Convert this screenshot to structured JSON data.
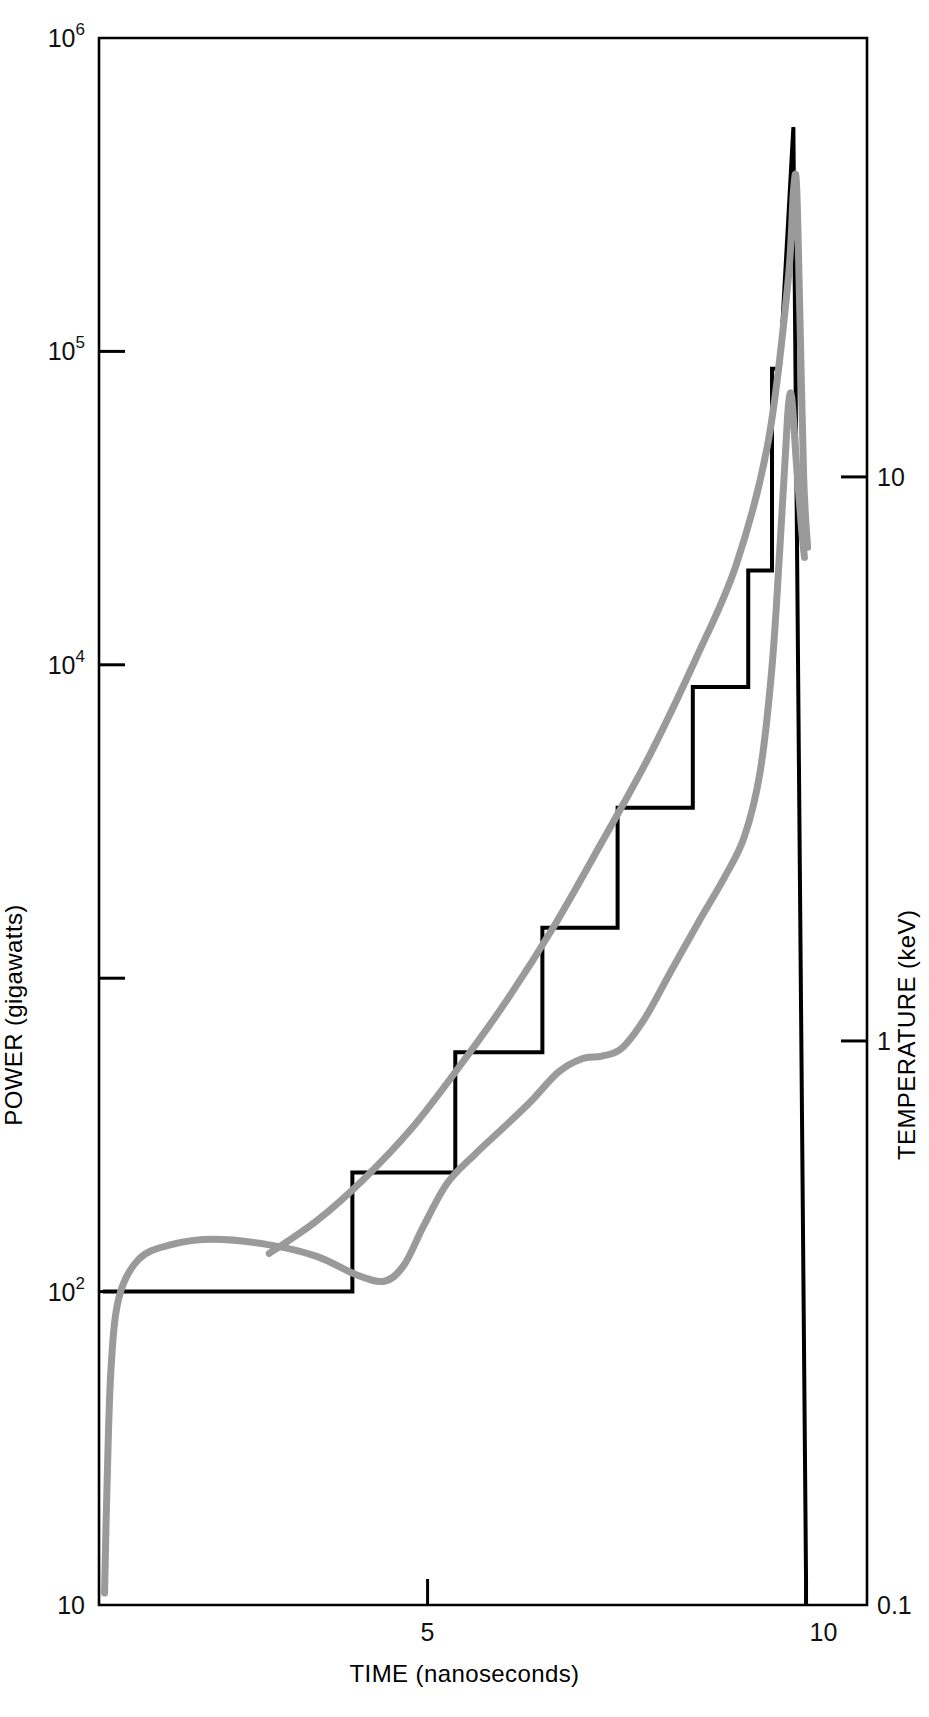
{
  "figure": {
    "background": "#ffffff",
    "frame_color": "#000000",
    "series_colors": {
      "power": "#000000",
      "temperature": "#9a9a9a"
    }
  },
  "axes": {
    "x": {
      "label": "TIME (nanoseconds)",
      "ticks": [
        {
          "value": 5,
          "label": "5"
        },
        {
          "value": 10,
          "label": "10"
        }
      ],
      "range": [
        0.85,
        10.55
      ],
      "scale": "linear"
    },
    "y_left": {
      "label": "POWER (gigawatts)",
      "scale": "log",
      "range": [
        10,
        1000000
      ],
      "ticks": [
        {
          "value": 10,
          "mantissa": "10",
          "label": "10",
          "exponent": ""
        },
        {
          "value": 100,
          "mantissa": "10",
          "label": "10",
          "exponent": "2"
        },
        {
          "value": 1000,
          "mantissa": "10",
          "label": "",
          "exponent": ""
        },
        {
          "value": 10000,
          "mantissa": "10",
          "label": "10",
          "exponent": "4"
        },
        {
          "value": 100000,
          "mantissa": "10",
          "label": "10",
          "exponent": "5"
        },
        {
          "value": 1000000,
          "mantissa": "10",
          "label": "10",
          "exponent": "6"
        }
      ]
    },
    "y_right": {
      "label": "TEMPERATURE (keV)",
      "scale": "log",
      "range": [
        0.1,
        60
      ],
      "ticks": [
        {
          "value": 0.1,
          "label": "0.1"
        },
        {
          "value": 1,
          "label": "1"
        },
        {
          "value": 10,
          "label": "10"
        }
      ]
    }
  },
  "chart_data": {
    "type": "line",
    "title": "",
    "subtitle": "",
    "xlabel": "TIME (nanoseconds)",
    "ylabel": "POWER (gigawatts)",
    "ylabel_right": "TEMPERATURE (keV)",
    "xlim": [
      0.85,
      10.55
    ],
    "ylim": [
      10,
      1000000
    ],
    "ylim_right": [
      0.1,
      60
    ],
    "xscale": "linear",
    "yscale": "log",
    "grid": false,
    "legend": "none",
    "series": [
      {
        "name": "Power (drive pulse, staircase)",
        "axis": "left",
        "color": "#000000",
        "linewidth": 4,
        "style": "step-then-spike",
        "points": [
          [
            0.9,
            100
          ],
          [
            4.05,
            100
          ],
          [
            4.05,
            240
          ],
          [
            5.35,
            240
          ],
          [
            5.35,
            580
          ],
          [
            6.45,
            580
          ],
          [
            6.45,
            1450
          ],
          [
            7.4,
            1450
          ],
          [
            7.4,
            3500
          ],
          [
            8.35,
            3500
          ],
          [
            8.35,
            8500
          ],
          [
            9.05,
            8500
          ],
          [
            9.05,
            20000
          ],
          [
            9.35,
            20000
          ],
          [
            9.35,
            88000
          ],
          [
            9.45,
            88000
          ],
          [
            9.62,
            520000
          ],
          [
            9.78,
            12
          ],
          [
            9.78,
            10
          ]
        ]
      },
      {
        "name": "Temperature (upper gray curve)",
        "axis": "right",
        "color": "#9a9a9a",
        "linewidth": 7,
        "style": "smooth",
        "points": [
          [
            3.0,
            0.42
          ],
          [
            3.6,
            0.48
          ],
          [
            4.2,
            0.57
          ],
          [
            4.8,
            0.7
          ],
          [
            5.4,
            0.9
          ],
          [
            6.0,
            1.18
          ],
          [
            6.6,
            1.6
          ],
          [
            7.2,
            2.25
          ],
          [
            7.8,
            3.2
          ],
          [
            8.4,
            4.8
          ],
          [
            8.9,
            7.0
          ],
          [
            9.3,
            11.5
          ],
          [
            9.55,
            22.0
          ],
          [
            9.62,
            32.0
          ],
          [
            9.66,
            33.0
          ],
          [
            9.7,
            20.0
          ],
          [
            9.75,
            10.0
          ],
          [
            9.8,
            7.5
          ]
        ]
      },
      {
        "name": "Temperature (lower gray curve)",
        "axis": "right",
        "color": "#9a9a9a",
        "linewidth": 7,
        "style": "smooth",
        "points": [
          [
            0.92,
            0.105
          ],
          [
            0.95,
            0.16
          ],
          [
            1.0,
            0.26
          ],
          [
            1.1,
            0.35
          ],
          [
            1.35,
            0.41
          ],
          [
            1.75,
            0.435
          ],
          [
            2.3,
            0.445
          ],
          [
            3.0,
            0.435
          ],
          [
            3.6,
            0.415
          ],
          [
            4.1,
            0.385
          ],
          [
            4.45,
            0.375
          ],
          [
            4.7,
            0.4
          ],
          [
            4.95,
            0.47
          ],
          [
            5.25,
            0.56
          ],
          [
            5.6,
            0.63
          ],
          [
            5.95,
            0.7
          ],
          [
            6.3,
            0.78
          ],
          [
            6.65,
            0.88
          ],
          [
            6.95,
            0.93
          ],
          [
            7.2,
            0.94
          ],
          [
            7.45,
            0.97
          ],
          [
            7.75,
            1.1
          ],
          [
            8.1,
            1.35
          ],
          [
            8.45,
            1.65
          ],
          [
            8.75,
            1.95
          ],
          [
            9.0,
            2.3
          ],
          [
            9.2,
            3.0
          ],
          [
            9.35,
            4.6
          ],
          [
            9.45,
            7.5
          ],
          [
            9.52,
            11.0
          ],
          [
            9.56,
            13.5
          ],
          [
            9.6,
            13.8
          ],
          [
            9.66,
            10.5
          ],
          [
            9.72,
            8.2
          ],
          [
            9.76,
            7.2
          ]
        ]
      }
    ]
  },
  "plot_geometry": {
    "left_px": 99,
    "right_px": 867,
    "top_px": 38,
    "bottom_px": 1605
  }
}
